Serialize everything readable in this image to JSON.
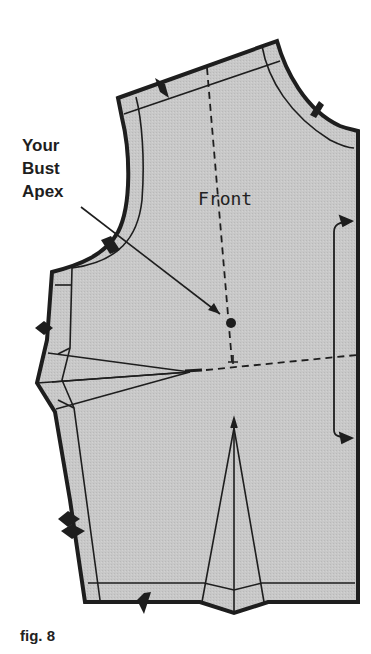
{
  "figure": {
    "title_label": "Front",
    "annotation": {
      "lines": [
        "Your",
        "Bust",
        "Apex"
      ]
    },
    "caption": "fig. 8",
    "colors": {
      "fill": "#c9c9c9",
      "stroke": "#1e1e1e",
      "background": "#ffffff"
    }
  }
}
